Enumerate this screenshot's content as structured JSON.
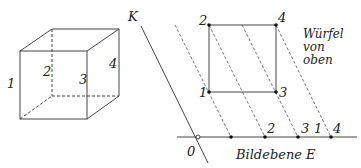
{
  "cube": {
    "edge_labels": [
      "1",
      "2",
      "3",
      "4"
    ]
  },
  "projection": {
    "axis_label": "K",
    "origin_label": "0",
    "plane_label": "Bildebene E",
    "top_view_label": [
      "Würfel",
      "von",
      "oben"
    ],
    "square_corners": {
      "top_left": "2",
      "top_right": "4",
      "bottom_left": "1",
      "bottom_right": "3"
    },
    "baseline_labels": [
      "2",
      "3",
      "1",
      "4"
    ]
  },
  "colors": {
    "line": "#444444",
    "dashed": "#666666"
  }
}
